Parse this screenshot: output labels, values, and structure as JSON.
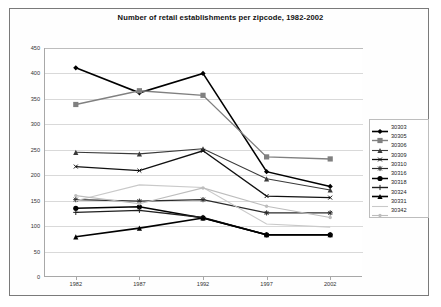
{
  "chart_data": {
    "type": "line",
    "title": "Number of retail establishments per zipcode, 1982-2002",
    "xlabel": "",
    "ylabel": "",
    "x": [
      1982,
      1987,
      1992,
      1997,
      2002
    ],
    "categories": [
      "1982",
      "1987",
      "1992",
      "1997",
      "2002"
    ],
    "ylim": [
      0,
      450
    ],
    "yticks": [
      0,
      50,
      100,
      150,
      200,
      250,
      300,
      350,
      400,
      450
    ],
    "ytick_labels": [
      "0",
      "50",
      "100",
      "150",
      "200",
      "250",
      "300",
      "350",
      "400",
      "450"
    ],
    "grid": true,
    "legend_position": "right",
    "series": [
      {
        "name": "30303",
        "values": [
          411,
          362,
          400,
          207,
          178
        ],
        "color": "#000000",
        "marker": "diamond",
        "width": 1.6
      },
      {
        "name": "30305",
        "values": [
          339,
          366,
          357,
          236,
          232
        ],
        "color": "#808080",
        "marker": "square",
        "width": 1.4
      },
      {
        "name": "30306",
        "values": [
          245,
          242,
          252,
          193,
          171
        ],
        "color": "#3a3a3a",
        "marker": "triangle",
        "width": 1.1
      },
      {
        "name": "30309",
        "values": [
          217,
          209,
          248,
          159,
          156
        ],
        "color": "#111111",
        "marker": "cross",
        "width": 1.3
      },
      {
        "name": "30310",
        "values": [
          152,
          149,
          152,
          126,
          126
        ],
        "color": "#2b2b2b",
        "marker": "star",
        "width": 1.2
      },
      {
        "name": "30316",
        "values": [
          135,
          138,
          116,
          83,
          83
        ],
        "color": "#000000",
        "marker": "circle",
        "width": 1.5
      },
      {
        "name": "30318",
        "values": [
          127,
          131,
          117,
          83,
          83
        ],
        "color": "#1f1f1f",
        "marker": "plus",
        "width": 1.4
      },
      {
        "name": "30324",
        "values": [
          79,
          96,
          116,
          83,
          83
        ],
        "color": "#000000",
        "marker": "triangle",
        "width": 1.6
      },
      {
        "name": "30331",
        "values": [
          150,
          181,
          176,
          104,
          98
        ],
        "color": "#c9c9c9",
        "marker": "none",
        "width": 1.1
      },
      {
        "name": "30342",
        "values": [
          160,
          144,
          175,
          139,
          117
        ],
        "color": "#bdbdbd",
        "marker": "dot",
        "width": 1.1
      }
    ]
  }
}
